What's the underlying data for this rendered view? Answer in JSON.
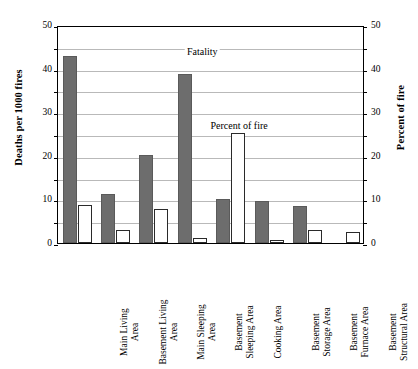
{
  "chart_data": {
    "type": "bar",
    "title": "",
    "xlabel": "",
    "ylabel": "Deaths per 1000 fires",
    "y2label": "Percent of fire",
    "ylim": [
      0,
      50
    ],
    "y2lim": [
      0,
      50
    ],
    "yticks": [
      0,
      10,
      20,
      30,
      40,
      50
    ],
    "y2ticks": [
      0,
      10,
      20,
      30,
      40,
      50
    ],
    "gridlines": [
      5,
      10,
      15,
      20,
      25,
      30,
      35,
      40,
      45
    ],
    "grid": true,
    "legend_position": "in-plot-annotations",
    "categories": [
      "Main Living\nArea",
      "Basement Living\nArea",
      "Main Sleeping\nArea",
      "Basement\nSleeping Area",
      "Cooking Area",
      "Basement\nStorage Area",
      "Basement\nFurnace Area",
      "Basement\nStructural Area"
    ],
    "series": [
      {
        "name": "Fatality",
        "color": "#6d6d6d",
        "values": [
          43.0,
          11.3,
          20.3,
          38.8,
          10.2,
          9.7,
          8.4,
          0.0
        ]
      },
      {
        "name": "Percent of fire",
        "color": "#ffffff",
        "values": [
          8.7,
          3.0,
          7.7,
          1.1,
          25.3,
          0.8,
          2.9,
          2.5
        ]
      }
    ],
    "annotations": [
      {
        "text": "Fatality",
        "x_frac": 0.47,
        "y_value": 44.2
      },
      {
        "text": "Percent of fire",
        "x_frac": 0.59,
        "y_value": 27.4
      }
    ]
  },
  "axes": {
    "left": {
      "title": "Deaths per 1000 fires",
      "ticks": [
        "0",
        "10",
        "20",
        "30",
        "40",
        "50"
      ]
    },
    "right": {
      "title": "Percent of fire",
      "ticks": [
        "0",
        "10",
        "20",
        "30",
        "40",
        "50"
      ]
    }
  }
}
